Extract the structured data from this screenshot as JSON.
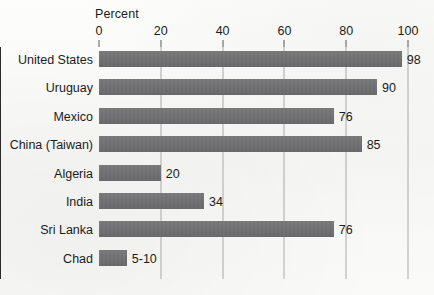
{
  "chart_data": {
    "type": "bar",
    "orientation": "horizontal",
    "title": "",
    "xlabel": "Percent",
    "ylabel": "",
    "xlim": [
      0,
      100
    ],
    "xticks": [
      0,
      20,
      40,
      60,
      80,
      100
    ],
    "xtick_labels": [
      "0",
      "20",
      "40",
      "60",
      "80",
      "100"
    ],
    "grid": true,
    "legend": "none",
    "bar_color": "#6e6e70",
    "categories": [
      "United States",
      "Uruguay",
      "Mexico",
      "China (Taiwan)",
      "Algeria",
      "India",
      "Sri Lanka",
      "Chad"
    ],
    "values": [
      98,
      90,
      76,
      85,
      20,
      34,
      76,
      9
    ],
    "value_labels": [
      "98",
      "90",
      "76",
      "85",
      "20",
      "34",
      "76",
      "5-10"
    ],
    "bars": [
      {
        "category": "United States",
        "value": 98,
        "label": "98"
      },
      {
        "category": "Uruguay",
        "value": 90,
        "label": "90"
      },
      {
        "category": "Mexico",
        "value": 76,
        "label": "76"
      },
      {
        "category": "China (Taiwan)",
        "value": 85,
        "label": "85"
      },
      {
        "category": "Algeria",
        "value": 20,
        "label": "20"
      },
      {
        "category": "India",
        "value": 34,
        "label": "34"
      },
      {
        "category": "Sri Lanka",
        "value": 76,
        "label": "76"
      },
      {
        "category": "Chad",
        "value": 9,
        "label": "5-10"
      }
    ]
  }
}
